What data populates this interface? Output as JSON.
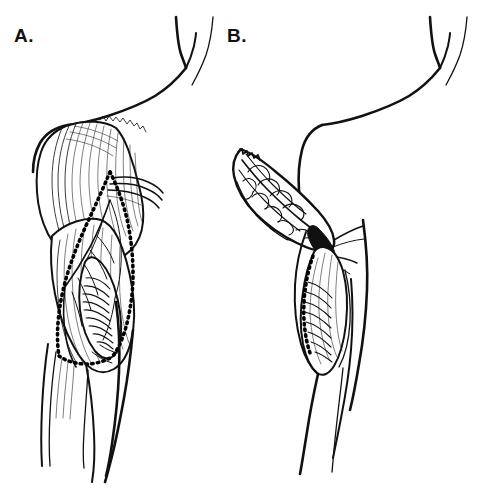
{
  "figure": {
    "type": "medical-line-illustration",
    "style": "black-and-white pen-and-ink line drawing",
    "background_color": "#ffffff",
    "ink_color": "#111111",
    "width": 485,
    "height": 492
  },
  "panels": [
    {
      "id": "A",
      "label": "A.",
      "label_x": 14,
      "label_y": 42,
      "title": "Anatomy with planned incision",
      "description": "Lateral view of shoulder and upper arm showing the deltoid and underlying arm musculature with the planned flap outlined by a dotted incision line.",
      "elements": [
        "neck-contour",
        "shoulder-contour",
        "deltoid-muscle",
        "deltoid-striations",
        "biceps-triceps-group",
        "tendon-bands",
        "neurovascular-bundle",
        "dotted-incision-outline",
        "forearm-outline",
        "trunk-outline"
      ]
    },
    {
      "id": "B",
      "label": "B.",
      "label_x": 227,
      "label_y": 42,
      "title": "Flap elevated and rotated",
      "description": "The muscle flap has been raised off the donor bed and rotated anteriorly, displaying its deep surface with the vascular pedicle; the residual muscle belly remains in the donor site below.",
      "elements": [
        "neck-contour",
        "shoulder-contour",
        "elevated-muscle-flap",
        "flap-deep-surface-vasculature",
        "vascular-pedicle",
        "donor-site-muscle-belly",
        "donor-bed-hatching",
        "arm-outline",
        "trunk-outline"
      ]
    }
  ],
  "annotations": {
    "incision_line_style": "dotted",
    "incision_line_meaning": "planned skin / muscle incision marking the flap boundary",
    "pedicle_meaning": "point where the flap stays attached to its blood supply"
  }
}
